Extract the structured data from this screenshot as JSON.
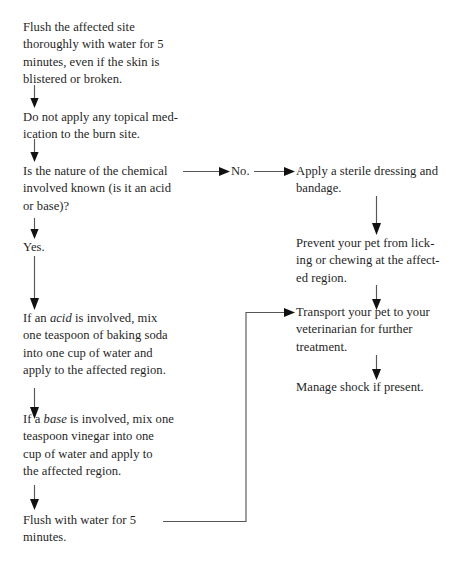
{
  "document": {
    "title": "Chemical Burn First Aid Flowchart",
    "background_color": "#ffffff",
    "text_color": "#1f1f1f",
    "edge_color": "#575757",
    "arrowhead_color": "#111111"
  },
  "left_column": {
    "steps": [
      {
        "id": "flush-site",
        "text": "Flush the affected site\nthoroughly with water for 5\nminutes, even if the skin is\nblistered or broken."
      },
      {
        "id": "no-topical",
        "text": "Do not apply any topical med-\nication to the burn site."
      },
      {
        "id": "nature-known",
        "text": "Is the nature of the chemical\ninvolved known (is it an acid\nor base)?"
      },
      {
        "id": "yes",
        "text": "Yes."
      },
      {
        "id": "acid-treatment",
        "text_before": "If an ",
        "text_italic": "acid",
        "text_after": " is involved, mix\none teaspoon of baking soda\ninto one cup of water and\napply to the affected region."
      },
      {
        "id": "base-treatment",
        "text_before": "If a ",
        "text_italic": "base",
        "text_after": " is involved, mix one\nteaspoon vinegar into one\ncup of water and apply to\nthe affected region."
      },
      {
        "id": "flush-five",
        "text": "Flush with water for 5\nminutes."
      }
    ]
  },
  "branch": {
    "no_label": "No."
  },
  "right_column": {
    "steps": [
      {
        "id": "sterile-dressing",
        "text": "Apply a sterile dressing and\nbandage."
      },
      {
        "id": "prevent-licking",
        "text": "Prevent your pet from lick-\ning or chewing at the affect-\ned region."
      },
      {
        "id": "transport",
        "text": "Transport your pet to your\nveterinarian for further\ntreatment."
      },
      {
        "id": "manage-shock",
        "text": "Manage shock if present."
      }
    ]
  }
}
